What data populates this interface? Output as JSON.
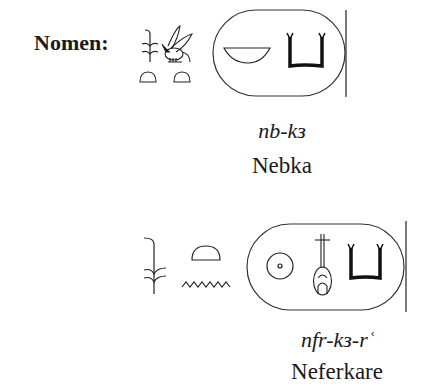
{
  "nomen": {
    "label": "Nomen:",
    "entries": [
      {
        "prefix_glyphs": [
          "sedge-plant",
          "bee",
          "bread-loaf",
          "bread-loaf"
        ],
        "cartouche_glyphs": [
          "basket",
          "ka-arms"
        ],
        "transliteration": "nb-kз",
        "name": "Nebka"
      },
      {
        "prefix_glyphs": [
          "sedge-plant",
          "bread-loaf",
          "water-ripple"
        ],
        "cartouche_glyphs": [
          "sun-disk",
          "nefer-heart-windpipe",
          "ka-arms"
        ],
        "transliteration": "nfr-kз-rʿ",
        "name": "Neferkare"
      }
    ]
  }
}
